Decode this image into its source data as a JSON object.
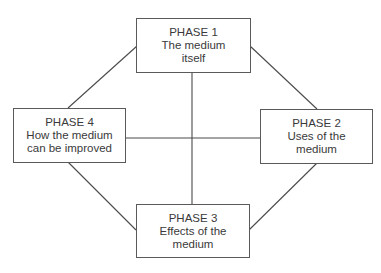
{
  "diagram": {
    "line_color": "#4a4a4a",
    "border_color": "#5a5a5a",
    "text_color": "#3a3a3a",
    "phases": {
      "phase1": {
        "title": "PHASE 1",
        "line1": "The medium",
        "line2": "itself"
      },
      "phase2": {
        "title": "PHASE 2",
        "line1": "Uses of the",
        "line2": "medium"
      },
      "phase3": {
        "title": "PHASE 3",
        "line1": "Effects of the",
        "line2": "medium"
      },
      "phase4": {
        "title": "PHASE 4",
        "line1": "How the medium",
        "line2": "can be improved"
      }
    },
    "connections": [
      {
        "from": "phase1",
        "to": "phase2"
      },
      {
        "from": "phase2",
        "to": "phase3"
      },
      {
        "from": "phase3",
        "to": "phase4"
      },
      {
        "from": "phase4",
        "to": "phase1"
      },
      {
        "from": "phase1",
        "to": "phase3"
      },
      {
        "from": "phase4",
        "to": "phase2"
      }
    ]
  }
}
